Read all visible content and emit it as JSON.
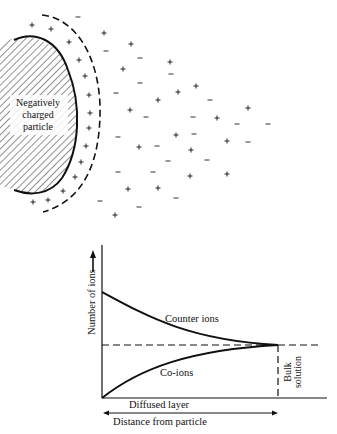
{
  "particle": {
    "label_lines": [
      "Negatively",
      "charged",
      "particle"
    ]
  },
  "ions": {
    "plus_symbol": "+",
    "minus_symbol": "−",
    "plus_positions": [
      [
        32,
        25
      ],
      [
        51,
        29
      ],
      [
        69,
        42
      ],
      [
        79,
        60
      ],
      [
        85,
        76
      ],
      [
        89,
        95
      ],
      [
        90,
        113
      ],
      [
        89,
        128
      ],
      [
        86,
        146
      ],
      [
        81,
        162
      ],
      [
        75,
        177
      ],
      [
        63,
        191
      ],
      [
        48,
        200
      ],
      [
        33,
        202
      ],
      [
        104,
        33
      ],
      [
        131,
        44
      ],
      [
        170,
        62
      ],
      [
        123,
        69
      ],
      [
        196,
        86
      ],
      [
        178,
        92
      ],
      [
        158,
        100
      ],
      [
        130,
        110
      ],
      [
        217,
        118
      ],
      [
        248,
        108
      ],
      [
        176,
        135
      ],
      [
        227,
        141
      ],
      [
        139,
        147
      ],
      [
        191,
        150
      ],
      [
        190,
        176
      ],
      [
        227,
        174
      ],
      [
        128,
        189
      ],
      [
        158,
        188
      ],
      [
        115,
        215
      ]
    ],
    "minus_positions": [
      [
        78,
        17
      ],
      [
        106,
        51
      ],
      [
        140,
        58
      ],
      [
        171,
        74
      ],
      [
        140,
        83
      ],
      [
        116,
        93
      ],
      [
        210,
        100
      ],
      [
        146,
        117
      ],
      [
        193,
        117
      ],
      [
        237,
        124
      ],
      [
        268,
        124
      ],
      [
        118,
        137
      ],
      [
        194,
        134
      ],
      [
        157,
        146
      ],
      [
        248,
        142
      ],
      [
        168,
        161
      ],
      [
        207,
        160
      ],
      [
        118,
        172
      ],
      [
        153,
        172
      ],
      [
        176,
        198
      ],
      [
        139,
        207
      ],
      [
        100,
        201
      ]
    ]
  },
  "graph": {
    "y_axis_label": "Number of ions",
    "x_axis_label": "Distance from particle",
    "region_label_diffused": "Diffused layer",
    "region_label_bulk_line1": "Bulk",
    "region_label_bulk_line2": "solution",
    "curve_counter_label": "Counter ions",
    "curve_co_label": "Co-ions"
  },
  "chart_data": {
    "type": "line",
    "title": "",
    "xlabel": "Distance from particle",
    "ylabel": "Number of ions",
    "series": [
      {
        "name": "Counter ions",
        "description": "high near particle, decays exponentially to bulk level",
        "x": [
          0,
          0.25,
          0.5,
          0.75,
          1.0
        ],
        "values": [
          1.65,
          1.3,
          1.12,
          1.03,
          1.0
        ]
      },
      {
        "name": "Co-ions",
        "description": "zero at particle surface, rises to bulk level",
        "x": [
          0,
          0.25,
          0.5,
          0.75,
          1.0
        ],
        "values": [
          0.0,
          0.55,
          0.82,
          0.95,
          1.0
        ]
      },
      {
        "name": "Bulk concentration (dashed)",
        "x": [
          0,
          1.2
        ],
        "values": [
          1.0,
          1.0
        ]
      }
    ],
    "regions": [
      {
        "label": "Diffused layer",
        "x_range": [
          0,
          1.0
        ]
      },
      {
        "label": "Bulk solution",
        "x_range": [
          1.0,
          1.2
        ]
      }
    ],
    "grid": false,
    "legend": "inline labels"
  }
}
